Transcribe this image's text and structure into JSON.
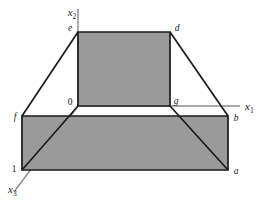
{
  "figure": {
    "background_color": "#ffffff",
    "fill_color": "#9a9a9a",
    "edge_color": "#1a1a1a",
    "axis_color": "#8c8c8c",
    "axes": [
      {
        "id": "x1",
        "base": "x",
        "sub": "1"
      },
      {
        "id": "x2",
        "base": "x",
        "sub": "2"
      },
      {
        "id": "x3",
        "base": "x",
        "sub": "3"
      }
    ],
    "vertices": [
      {
        "id": "e",
        "label": "e"
      },
      {
        "id": "d",
        "label": "d"
      },
      {
        "id": "origin",
        "label": "0"
      },
      {
        "id": "g",
        "label": "g"
      },
      {
        "id": "f",
        "label": "f"
      },
      {
        "id": "b",
        "label": "b"
      },
      {
        "id": "one",
        "label": "1"
      },
      {
        "id": "a",
        "label": "a"
      }
    ]
  }
}
